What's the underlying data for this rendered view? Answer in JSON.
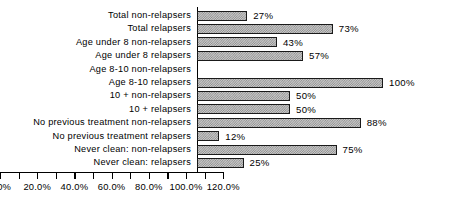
{
  "chart_data": {
    "type": "bar",
    "orientation": "horizontal",
    "title": "",
    "xlabel": "",
    "ylabel": "",
    "xlim": [
      0,
      120
    ],
    "xticks": [
      0,
      20,
      40,
      60,
      80,
      100,
      120
    ],
    "xtick_labels": [
      "0.0%",
      "20.0%",
      "40.0%",
      "60.0%",
      "80.0%",
      "100.0%",
      "120.0%"
    ],
    "minor_tick_step": 10,
    "grid": false,
    "legend": false,
    "value_label_suffix": "%",
    "categories": [
      "Total non-relapsers",
      "Total relapsers",
      "Age under 8 non-relapsers",
      "Age under 8 relapsers",
      "Age 8-10 non-relapsers",
      "Age 8-10 relapsers",
      "10 + non-relapsers",
      "10 + relapsers",
      "No previous treatment non-relapsers",
      "No previous treatment relapsers",
      "Never clean: non-relapsers",
      "Never clean: relapsers"
    ],
    "values": [
      27,
      73,
      43,
      57,
      0,
      100,
      50,
      50,
      88,
      12,
      75,
      25
    ],
    "value_labels": [
      "27%",
      "73%",
      "43%",
      "57%",
      "",
      "100%",
      "50%",
      "50%",
      "88%",
      "12%",
      "75%",
      "25%"
    ],
    "colors": {
      "bar_fill": "#c9c9c9",
      "bar_hatch": "#8a8a8a",
      "bar_edge": "#1a1a1a",
      "axis": "#000000",
      "text": "#000000",
      "background": "#ffffff"
    }
  }
}
